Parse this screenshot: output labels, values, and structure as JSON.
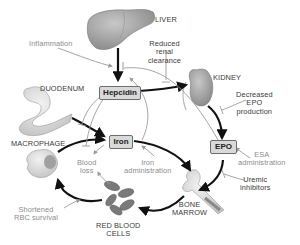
{
  "organs": {
    "liver": "LIVER",
    "kidney": "KIDNEY",
    "duodenum": "DUODENUM",
    "macrophage": "MACROPHAGE",
    "bone_marrow_l1": "BONE",
    "bone_marrow_l2": "MARROW",
    "rbc_l1": "RED BLOOD",
    "rbc_l2": "CELLS"
  },
  "nodes": {
    "hepcidin": "Hepcidin",
    "iron": "Iron",
    "epo": "EPO"
  },
  "modifiers": {
    "inflammation": "Inflammation",
    "reduced_renal_clearance": [
      "Reduced",
      "renal",
      "clearance"
    ],
    "decreased_epo_production": [
      "Decreased",
      "EPO",
      "production"
    ],
    "esa_administration": [
      "ESA",
      "administration"
    ],
    "uremic_inhibitors": [
      "Uremic",
      "inhibitors"
    ],
    "blood_loss": [
      "Blood",
      "loss"
    ],
    "iron_administration": [
      "Iron",
      "administration"
    ],
    "shortened_rbc_survival": [
      "Shortened",
      "RBC survival"
    ]
  },
  "colors": {
    "main_arrow": "#111111",
    "modifier_arrow": "#9a9a9a",
    "node_fill": "#d9d9d9",
    "organ_fill": "#a8a8a8",
    "rbc_fill": "#7a7a7a"
  }
}
